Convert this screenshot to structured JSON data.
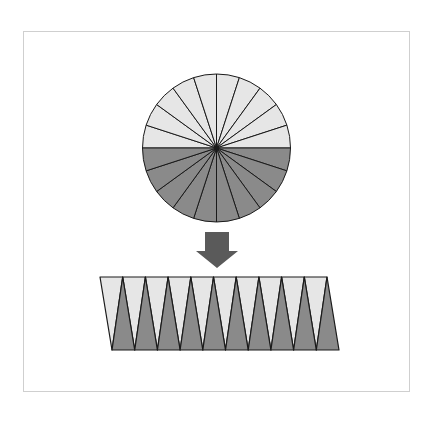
{
  "diagram": {
    "circle": {
      "sectors_top_half": 10,
      "sectors_bottom_half": 10,
      "total_sectors": 20
    },
    "rearranged_strip": {
      "light_pieces": 10,
      "dark_pieces": 10
    },
    "arrow": {
      "direction": "down"
    },
    "colors": {
      "light_fill": "#e6e6e6",
      "dark_fill": "#8a8a8a",
      "stroke": "#1a1a1a",
      "arrow": "#5a5a5a",
      "frame": "#cfcfcf"
    }
  }
}
